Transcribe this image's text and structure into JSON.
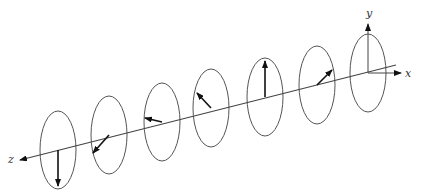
{
  "diagram": {
    "title": "",
    "axis_labels": {
      "x": "x",
      "y": "y",
      "z": "z"
    },
    "line_color": "#444444",
    "arrow_color": "#111111",
    "ellipse_color": "#555555",
    "propagation_axis": {
      "from": [
        396,
        65
      ],
      "to": [
        20,
        160
      ]
    },
    "frames": [
      {
        "cx": 58,
        "cy": 150,
        "rx": 18,
        "ry": 39,
        "vector": {
          "dx": 0,
          "dy": 36
        }
      },
      {
        "cx": 109,
        "cy": 135,
        "rx": 18,
        "ry": 39,
        "vector": {
          "dx": -16,
          "dy": 18
        }
      },
      {
        "cx": 162,
        "cy": 122,
        "rx": 18,
        "ry": 39,
        "vector": {
          "dx": -17,
          "dy": -4
        }
      },
      {
        "cx": 211,
        "cy": 108,
        "rx": 18,
        "ry": 39,
        "vector": {
          "dx": -14,
          "dy": -15
        }
      },
      {
        "cx": 265,
        "cy": 97,
        "rx": 18,
        "ry": 39,
        "vector": {
          "dx": 0,
          "dy": -36
        }
      },
      {
        "cx": 317,
        "cy": 85,
        "rx": 18,
        "ry": 39,
        "vector": {
          "dx": 15,
          "dy": -15
        }
      },
      {
        "cx": 368,
        "cy": 73,
        "rx": 18,
        "ry": 39,
        "vector": {
          "dx": 16,
          "dy": 0
        }
      }
    ]
  }
}
